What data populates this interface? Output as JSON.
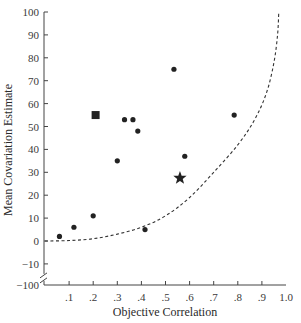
{
  "chart_data": {
    "type": "scatter",
    "title": "",
    "xlabel": "Objective Correlation",
    "ylabel": "Mean Covariation Estimate",
    "xlim": [
      0,
      1.0
    ],
    "ylim": [
      0,
      100
    ],
    "y_break_value": -100,
    "grid": false,
    "x_ticks": [
      0.1,
      0.2,
      0.3,
      0.4,
      0.5,
      0.6,
      0.7,
      0.8,
      0.9,
      1.0
    ],
    "x_tick_labels": [
      ".1",
      ".2",
      ".3",
      ".4",
      ".5",
      ".6",
      ".7",
      ".8",
      ".9",
      "1.0"
    ],
    "y_ticks": [
      100,
      90,
      80,
      70,
      60,
      50,
      40,
      30,
      20,
      10,
      0,
      -10
    ],
    "y_tick_labels": [
      "100",
      "90",
      "80",
      "70",
      "60",
      "50",
      "40",
      "30",
      "20",
      "10",
      "0",
      "−10"
    ],
    "y_break_label": "−100",
    "points": [
      {
        "x": 0.06,
        "y": 2,
        "marker": "circle"
      },
      {
        "x": 0.12,
        "y": 6,
        "marker": "circle"
      },
      {
        "x": 0.2,
        "y": 11,
        "marker": "circle"
      },
      {
        "x": 0.21,
        "y": 55,
        "marker": "square"
      },
      {
        "x": 0.3,
        "y": 35,
        "marker": "circle"
      },
      {
        "x": 0.33,
        "y": 53,
        "marker": "circle"
      },
      {
        "x": 0.365,
        "y": 53,
        "marker": "circle"
      },
      {
        "x": 0.385,
        "y": 48,
        "marker": "circle"
      },
      {
        "x": 0.415,
        "y": 5,
        "marker": "circle"
      },
      {
        "x": 0.535,
        "y": 75,
        "marker": "circle"
      },
      {
        "x": 0.58,
        "y": 37,
        "marker": "circle"
      },
      {
        "x": 0.56,
        "y": 27.5,
        "marker": "star"
      },
      {
        "x": 0.785,
        "y": 55,
        "marker": "circle"
      }
    ],
    "curve": {
      "style": "dashed",
      "points": [
        [
          0.0,
          0
        ],
        [
          0.1,
          0.2
        ],
        [
          0.2,
          1
        ],
        [
          0.3,
          3
        ],
        [
          0.4,
          6
        ],
        [
          0.5,
          11
        ],
        [
          0.6,
          19
        ],
        [
          0.7,
          30
        ],
        [
          0.8,
          42
        ],
        [
          0.87,
          53
        ],
        [
          0.92,
          65
        ],
        [
          0.95,
          78
        ],
        [
          0.965,
          90
        ],
        [
          0.97,
          100
        ]
      ]
    }
  }
}
